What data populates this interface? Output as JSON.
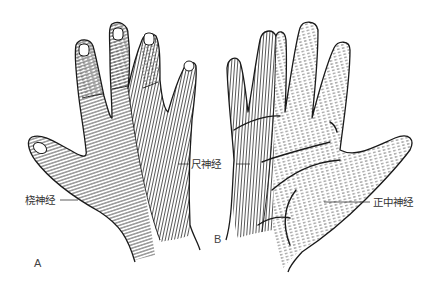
{
  "figure": {
    "type": "anatomical-diagram",
    "panels": [
      {
        "id": "A",
        "letter": "A",
        "view": "dorsal"
      },
      {
        "id": "B",
        "letter": "B",
        "view": "palmar"
      }
    ],
    "labels": {
      "radial": "桡神经",
      "ulnar": "尺神经",
      "median": "正中神经"
    },
    "legend_patterns": {
      "radial": "curved-horizontal-lines",
      "ulnar": "vertical-lines",
      "median": "dashed-lines"
    },
    "colors": {
      "background": "#ffffff",
      "ink": "#222222",
      "label_text": "#333333"
    }
  }
}
